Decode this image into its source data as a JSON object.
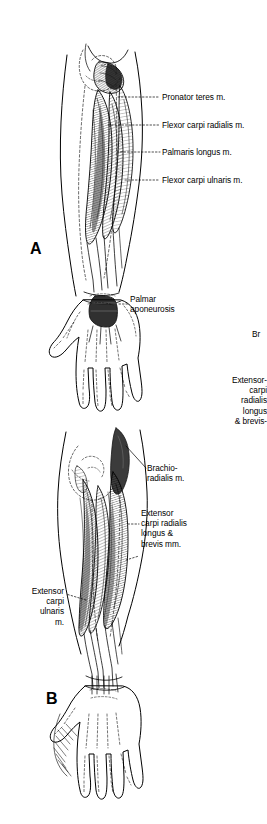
{
  "figure": {
    "background_color": "#ffffff",
    "ink_color": "#000000",
    "width": 267,
    "height": 824
  },
  "panels": [
    {
      "id": "A",
      "letter": "A",
      "view": "anterior-flexor-compartment"
    },
    {
      "id": "B",
      "letter": "B",
      "view": "posterior-extensor-compartment"
    }
  ],
  "labels": {
    "panel_a": [
      {
        "text": "Pronator teres m.",
        "leader": "dotted"
      },
      {
        "text": "Flexor carpi radialis m.",
        "leader": "dotted"
      },
      {
        "text": "Palmaris longus m.",
        "leader": "dotted"
      },
      {
        "text": "Flexor carpi ulnaris m.",
        "leader": "dotted"
      },
      {
        "text": "Palmar\naponeurosis",
        "leader": "dotted"
      }
    ],
    "panel_b": [
      {
        "text": "Brachio-\nradialis m.",
        "leader": "solid"
      },
      {
        "text": "Extensor\ncarpi radialis\nlongus &\nbrevis mm.",
        "leader": "dashed"
      },
      {
        "text": "Extensor\ncarpi\nulnaris\nm.",
        "leader": "dotted"
      }
    ],
    "cropped_right_edge": [
      {
        "text": "Br"
      },
      {
        "text": "Extensor-\ncarpi\nradialis\nlongus\n& brevis-"
      }
    ]
  }
}
